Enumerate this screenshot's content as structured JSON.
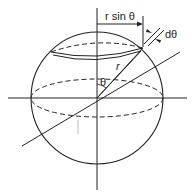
{
  "diagram": {
    "labels": {
      "r_sin_theta": "r sin θ",
      "d_theta": "dθ",
      "r": "r",
      "theta": "θ"
    },
    "colors": {
      "stroke": "#222222",
      "background": "#ffffff"
    }
  }
}
